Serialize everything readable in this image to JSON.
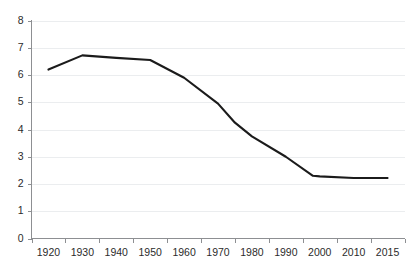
{
  "chart_data": {
    "type": "line",
    "title": "",
    "xlabel": "",
    "ylabel": "",
    "x": [
      1920,
      1930,
      1940,
      1950,
      1960,
      1970,
      1975,
      1980,
      1990,
      1998,
      2000,
      2010,
      2015
    ],
    "values": [
      6.2,
      6.72,
      6.63,
      6.55,
      5.9,
      4.95,
      4.25,
      3.75,
      3.0,
      2.3,
      2.28,
      2.22,
      2.22
    ],
    "series": [
      {
        "name": "series-1",
        "color": "#1b1b1b",
        "points": [
          {
            "x": 1920,
            "y": 6.2
          },
          {
            "x": 1930,
            "y": 6.72
          },
          {
            "x": 1940,
            "y": 6.63
          },
          {
            "x": 1950,
            "y": 6.55
          },
          {
            "x": 1960,
            "y": 5.9
          },
          {
            "x": 1970,
            "y": 4.95
          },
          {
            "x": 1975,
            "y": 4.25
          },
          {
            "x": 1980,
            "y": 3.75
          },
          {
            "x": 1990,
            "y": 3.0
          },
          {
            "x": 1998,
            "y": 2.3
          },
          {
            "x": 2000,
            "y": 2.28
          },
          {
            "x": 2010,
            "y": 2.22
          },
          {
            "x": 2015,
            "y": 2.22
          }
        ]
      }
    ],
    "xlim": [
      1915,
      2018
    ],
    "ylim": [
      0,
      8
    ],
    "ytick_values": [
      0,
      1,
      2,
      3,
      4,
      5,
      6,
      7,
      8
    ],
    "ytick_labels": [
      "0",
      "1",
      "2",
      "3",
      "4",
      "5",
      "6",
      "7",
      "8"
    ],
    "xtick_labels": [
      "1920",
      "1930",
      "1940",
      "1950",
      "1960",
      "1970",
      "1980",
      "1990",
      "2000",
      "2010",
      "2015"
    ],
    "grid": true,
    "grid_axis": "y",
    "legend": false,
    "legend_position": "none",
    "colors": {
      "line": "#1b1b1b",
      "grid": "#ebedef",
      "axis": "#8d8f92",
      "label_text": "#2b2b2b",
      "background": "#ffffff"
    }
  }
}
